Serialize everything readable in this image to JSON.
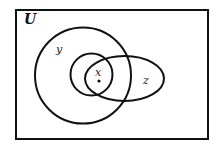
{
  "diagram": {
    "type": "venn",
    "universe_label": "U",
    "sets": [
      {
        "name": "y",
        "label": "y",
        "shape": "circle"
      },
      {
        "name": "x",
        "label": "x",
        "shape": "circle"
      },
      {
        "name": "z",
        "label": "z",
        "shape": "ellipse"
      }
    ],
    "point": {
      "label": "x",
      "description": "element in intersection of x, y and z"
    },
    "colors": {
      "stroke": "#111111",
      "background": "#ffffff"
    }
  }
}
